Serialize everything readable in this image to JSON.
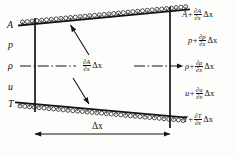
{
  "figure": {
    "background_color": "#fdfdfb",
    "line_color": "#141414"
  },
  "left_face_labels": [
    {
      "id": "area",
      "text": "A"
    },
    {
      "id": "pressure",
      "text": "p"
    },
    {
      "id": "density",
      "text": "ρ"
    },
    {
      "id": "velocity",
      "text": "u"
    },
    {
      "id": "temperature",
      "text": "T"
    }
  ],
  "right_face_labels": [
    {
      "id": "area",
      "base": "A",
      "operator": "+",
      "numerator": "∂A",
      "denominator": "∂x",
      "delta": "Δx"
    },
    {
      "id": "pressure",
      "base": "p",
      "operator": "+",
      "numerator": "∂p",
      "denominator": "∂x",
      "delta": "Δx"
    },
    {
      "id": "density",
      "base": "ρ",
      "operator": "+",
      "numerator": "∂ρ",
      "denominator": "∂x",
      "delta": "Δx"
    },
    {
      "id": "velocity",
      "base": "u",
      "operator": "+",
      "numerator": "∂u",
      "denominator": "∂x",
      "delta": "Δx"
    },
    {
      "id": "temperature",
      "base": "T",
      "operator": "+",
      "numerator": "∂T",
      "denominator": "∂x",
      "delta": "Δx"
    }
  ],
  "center_label": {
    "numerator": "∂A",
    "denominator": "∂x",
    "delta": "Δx"
  },
  "dimension_label": {
    "text": "Δx"
  }
}
